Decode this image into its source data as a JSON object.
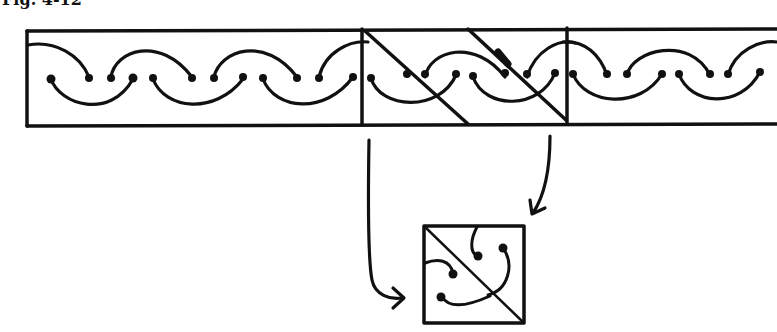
{
  "figure": {
    "caption": "Fig. 4-12",
    "ink_color": "#111111",
    "background": "#ffffff"
  },
  "strip": {
    "label": "scroll border strip",
    "segments": [
      {
        "name": "left-section",
        "x_start": 27,
        "x_end": 362
      },
      {
        "name": "marked-section",
        "x_start": 362,
        "x_end": 567,
        "has_diagonals": true
      },
      {
        "name": "right-section",
        "x_start": 567,
        "x_end": 777
      }
    ]
  },
  "arrows": [
    {
      "name": "left-arrow",
      "from": "marked-section-left",
      "to": "tile-left"
    },
    {
      "name": "right-arrow",
      "from": "marked-section-right",
      "to": "tile-top-right"
    }
  ],
  "tile": {
    "label": "repeat tile with diagonal"
  }
}
